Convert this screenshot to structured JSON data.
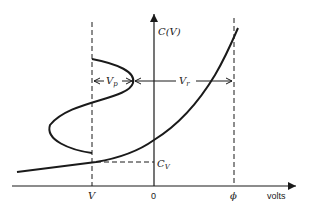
{
  "diagram": {
    "y_axis_label": "C(V)",
    "x_axis_unit_label": "volts",
    "x_ticks": [
      {
        "label": "V",
        "italic": true
      },
      {
        "label": "0",
        "italic": false
      },
      {
        "label": "ϕ",
        "italic": true
      }
    ],
    "annotations": {
      "vp_main": "V",
      "vp_sub": "p",
      "vr_main": "V",
      "vr_sub": "r",
      "cv_main": "C",
      "cv_sub": "V"
    },
    "colors": {
      "line": "#1a1a1a",
      "background": "#ffffff"
    }
  }
}
